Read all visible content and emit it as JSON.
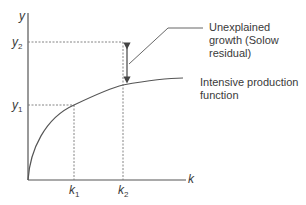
{
  "diagram": {
    "axes": {
      "x_label": "k",
      "y_label": "y"
    },
    "points": {
      "k1": {
        "label": "k",
        "sub": "1"
      },
      "k2": {
        "label": "k",
        "sub": "2"
      },
      "y1": {
        "label": "y",
        "sub": "1"
      },
      "y2": {
        "label": "y",
        "sub": "2"
      }
    },
    "annotations": {
      "residual": "Unexplained growth (Solow residual)",
      "curve": "Intensive production function"
    },
    "colors": {
      "axis": "#555555",
      "curve": "#555555",
      "dashed": "#777777",
      "text": "#3a3a3a"
    }
  }
}
